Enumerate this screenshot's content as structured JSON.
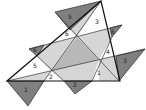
{
  "diagram": {
    "width": 146,
    "height": 110,
    "colors": {
      "background": "#ffffff",
      "dark_triangle": "#7f7f7f",
      "light_region": "#d6d6d6",
      "mid_region": "#b8b8b8",
      "white_region": "#ffffff",
      "outline": "#111111"
    },
    "main_triangle": {
      "points": "101,1 7,81 120,81"
    },
    "inner_triangle": {
      "points": "77,37 99,60 51,71"
    },
    "light_regions": [
      {
        "points": "70,30 101,1 77,37"
      },
      {
        "points": "44,45 77,37 51,71 37,56"
      },
      {
        "points": "77,37 110,28 112,37 99,60"
      },
      {
        "points": "99,60 116,56 120,81 99,81"
      },
      {
        "points": "51,71 99,60 92,81 64,81"
      },
      {
        "points": "7,81 51,71 44,81"
      }
    ],
    "dark_triangles": [
      {
        "id": "1",
        "points": "7,81 44,81 28,106",
        "label": "1",
        "lx": 26,
        "ly": 92
      },
      {
        "id": "2",
        "points": "64,81 92,81 75,94",
        "label": "2",
        "lx": 75,
        "ly": 87
      },
      {
        "id": "3",
        "points": "116,56 145,49 119,81",
        "label": "3",
        "lx": 125,
        "ly": 63
      },
      {
        "id": "4",
        "points": "110,28 122,25 112,37",
        "label": "6",
        "lx": 113,
        "ly": 34
      },
      {
        "id": "5",
        "points": "55,12 101,1 70,30",
        "label": "5",
        "lx": 70,
        "ly": 19
      },
      {
        "id": "6",
        "points": "29,49 44,45 37,56",
        "label": "6",
        "lx": 35,
        "ly": 52
      }
    ],
    "lines": [
      {
        "x1": 7,
        "y1": 81,
        "x2": 145,
        "y2": 49
      },
      {
        "x1": 55,
        "y1": 12,
        "x2": 119,
        "y2": 81
      },
      {
        "x1": 29,
        "y1": 49,
        "x2": 122,
        "y2": 25
      },
      {
        "x1": 44,
        "y1": 81,
        "x2": 101,
        "y2": 1
      },
      {
        "x1": 37,
        "y1": 56,
        "x2": 64,
        "y2": 81
      },
      {
        "x1": 112,
        "y1": 37,
        "x2": 92,
        "y2": 81
      }
    ],
    "interior_labels": [
      {
        "text": "3",
        "x": 97,
        "y": 24
      },
      {
        "text": "6",
        "x": 67,
        "y": 36
      },
      {
        "text": "4",
        "x": 108,
        "y": 54
      },
      {
        "text": "5",
        "x": 35,
        "y": 68
      },
      {
        "text": "2",
        "x": 51,
        "y": 79
      },
      {
        "text": "1",
        "x": 99,
        "y": 75
      }
    ]
  }
}
